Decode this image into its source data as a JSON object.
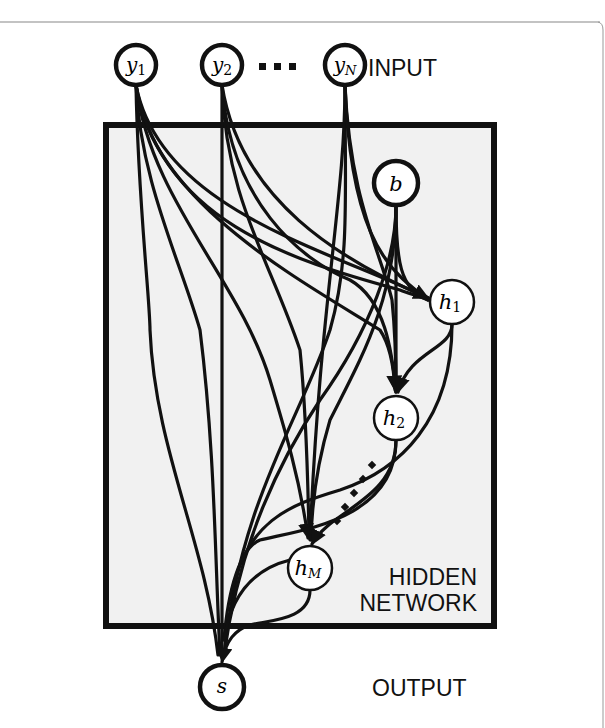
{
  "diagram": {
    "labels": {
      "input": "INPUT",
      "hidden_line1": "HIDDEN",
      "hidden_line2": "NETWORK",
      "output": "OUTPUT",
      "input_ellipsis": "▪ ▪ ▪"
    },
    "nodes": {
      "y1": {
        "base": "y",
        "sub": "1"
      },
      "y2": {
        "base": "y",
        "sub": "2"
      },
      "yN": {
        "base": "y",
        "sub": "N"
      },
      "b": {
        "base": "b",
        "sub": ""
      },
      "h1": {
        "base": "h",
        "sub": "1"
      },
      "h2": {
        "base": "h",
        "sub": "2"
      },
      "hM": {
        "base": "h",
        "sub": "M"
      },
      "s": {
        "base": "s",
        "sub": ""
      }
    },
    "colors": {
      "stroke": "#111111",
      "hidden_fill": "#f1f1f1",
      "node_fill": "#ffffff",
      "frame": "#888888"
    }
  }
}
